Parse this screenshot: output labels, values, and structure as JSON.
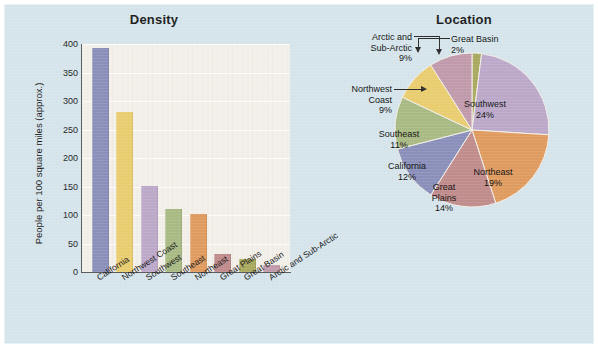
{
  "figure": {
    "background_color": "#d6e5ec",
    "plot_background_color": "#f3f0ea"
  },
  "bar_chart": {
    "title": "Density",
    "ylabel": "People per 100 square miles (approx.)",
    "yticks": [
      "0",
      "50",
      "100",
      "150",
      "200",
      "250",
      "300",
      "350",
      "400"
    ],
    "categories": [
      "California",
      "Northwest Coast",
      "Southwest",
      "Southeast",
      "Northeast",
      "Great Plains",
      "Great Basin",
      "Arctic and Sub-Arctic"
    ]
  },
  "pie_chart": {
    "title": "Location",
    "labels": [
      {
        "name": "Great Basin",
        "pct": "2%",
        "style": "callout"
      },
      {
        "name": "Southwest",
        "pct": "24%",
        "style": "inside"
      },
      {
        "name": "Northeast",
        "pct": "19%",
        "style": "inside"
      },
      {
        "name": "Great Plains",
        "pct": "14%",
        "style": "inside"
      },
      {
        "name": "California",
        "pct": "12%",
        "style": "inside"
      },
      {
        "name": "Southeast",
        "pct": "11%",
        "style": "inside"
      },
      {
        "name": "Northwest Coast",
        "pct": "9%",
        "style": "callout"
      },
      {
        "name": "Arctic and Sub-Arctic",
        "pct": "9%",
        "style": "callout"
      }
    ],
    "callout_text": {
      "great_basin_l1": "Great Basin",
      "great_basin_l2": "2%",
      "northwest_l1": "Northwest",
      "northwest_l2": "Coast",
      "northwest_l3": "9%",
      "arctic_l1": "Arctic and",
      "arctic_l2": "Sub-Arctic",
      "arctic_l3": "9%"
    },
    "inside_text": {
      "southwest_name": "Southwest",
      "southwest_pct": "24%",
      "northeast_name": "Northeast",
      "northeast_pct": "19%",
      "greatplains_l1": "Great",
      "greatplains_l2": "Plains",
      "greatplains_pct": "14%",
      "california_name": "California",
      "california_pct": "12%",
      "southeast_name": "Southeast",
      "southeast_pct": "11%"
    }
  },
  "chart_data": [
    {
      "type": "bar",
      "title": "Density",
      "xlabel": "",
      "ylabel": "People per 100 square miles (approx.)",
      "ylim": [
        0,
        400
      ],
      "ytick_values": [
        0,
        50,
        100,
        150,
        200,
        250,
        300,
        350,
        400
      ],
      "grid": true,
      "legend": "none",
      "categories": [
        "California",
        "Northwest Coast",
        "Southwest",
        "Southeast",
        "Northeast",
        "Great Plains",
        "Great Basin",
        "Arctic and Sub-Arctic"
      ],
      "values": [
        393,
        281,
        151,
        111,
        101,
        31,
        22,
        12
      ],
      "colors": [
        "#8b90bb",
        "#e9cd6f",
        "#bca9ca",
        "#a9ba84",
        "#e09b5f",
        "#c18c8c",
        "#a9a95f",
        "#c19bab"
      ]
    },
    {
      "type": "pie",
      "title": "Location",
      "legend": "labels-on-slices",
      "start_angle_deg": 0,
      "direction": "clockwise",
      "categories": [
        "Great Basin",
        "Southwest",
        "Northeast",
        "Great Plains",
        "California",
        "Southeast",
        "Northwest Coast",
        "Arctic and Sub-Arctic"
      ],
      "values": [
        2,
        24,
        19,
        14,
        12,
        11,
        9,
        9
      ],
      "unit": "percent",
      "colors": [
        "#a9a95f",
        "#bca9ca",
        "#e09b5f",
        "#c18c8c",
        "#8b90bb",
        "#a9ba84",
        "#e9cd6f",
        "#c19bab"
      ]
    }
  ]
}
